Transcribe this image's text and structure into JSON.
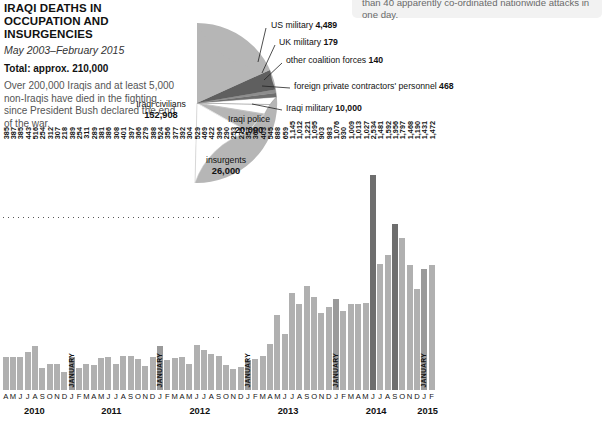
{
  "header": {
    "title": "IRAQI DEATHS IN OCCUPATION AND INSURGENCIES",
    "subtitle": "May 2003–February 2015",
    "total": "Total: approx. 210,000",
    "blurb": "Over 200,000 Iraqis and at least 5,000 non-Iraqis have died in the fighting since President Bush declared the end of the war."
  },
  "notebox": {
    "text": "than 40 apparently co-ordinated nationwide attacks in one day."
  },
  "pie_labels": {
    "civilians_name": "Iraqi civilians",
    "civilians_value": "152,908",
    "police_name": "Iraqi police",
    "police_value": "20,000",
    "insurgents_name": "insurgents",
    "insurgents_value": "26,000",
    "us_military": "US military",
    "us_military_value": "4,489",
    "uk_military": "UK military",
    "uk_military_value": "179",
    "other_coalition": "other coalition forces",
    "other_coalition_value": "140",
    "contractors": "foreign private contractors' personnel",
    "contractors_value": "468",
    "iraqi_military": "Iraqi military",
    "iraqi_military_value": "10,000"
  },
  "colors": {
    "pie_main": "#b6b6b6",
    "pie_dark": "#6e6e6e",
    "pie_mid": "#9a9a9a",
    "pie_light": "#ffffff",
    "bar_light": "#b0b0b0",
    "bar_dark": "#6e6e6e",
    "note_bg": "#f2f2f2"
  },
  "chart_data": {
    "type": "pie",
    "title": "IRAQI DEATHS IN OCCUPATION AND INSURGENCIES",
    "subtitle": "May 2003–February 2015",
    "total": 210000,
    "labels": [
      "Iraqi civilians",
      "Iraqi police",
      "insurgents",
      "Iraqi military",
      "foreign private contractors' personnel",
      "US military",
      "UK military",
      "other coalition forces"
    ],
    "values": [
      152908,
      20000,
      26000,
      10000,
      468,
      4489,
      179,
      140
    ],
    "legend": "labels placed around pie"
  },
  "chart_data_bars": {
    "type": "bar",
    "title": "Monthly Iraqi deaths",
    "xlabel": "",
    "ylabel": "",
    "ylim": [
      0,
      2534
    ],
    "grid": false,
    "categories": [
      "2010-A",
      "2010-M",
      "2010-J",
      "2010-J",
      "2010-A",
      "2010-S",
      "2010-O",
      "2010-N",
      "2010-D",
      "2011-JANUARY",
      "2011-F",
      "2011-M",
      "2011-A",
      "2011-M",
      "2011-J",
      "2011-J",
      "2011-A",
      "2011-S",
      "2011-O",
      "2011-N",
      "2011-D",
      "2012-JANUARY",
      "2012-F",
      "2012-M",
      "2012-A",
      "2012-M",
      "2012-J",
      "2012-J",
      "2012-A",
      "2012-S",
      "2012-O",
      "2012-N",
      "2012-D",
      "2013-JANUARY",
      "2013-F",
      "2013-M",
      "2013-A",
      "2013-M",
      "2013-J",
      "2013-J",
      "2013-A",
      "2013-S",
      "2013-O",
      "2013-N",
      "2013-D",
      "2014-JANUARY",
      "2014-F",
      "2014-M",
      "2014-A",
      "2014-M",
      "2014-J",
      "2014-J",
      "2014-A",
      "2014-S",
      "2014-O",
      "2014-N",
      "2014-D",
      "2015-JANUARY",
      "2015-F"
    ],
    "values": [
      385,
      387,
      385,
      443,
      516,
      254,
      312,
      307,
      218,
      389,
      254,
      311,
      289,
      381,
      386,
      308,
      401,
      397,
      366,
      279,
      388,
      524,
      356,
      377,
      392,
      304,
      529,
      469,
      422,
      396,
      290,
      253,
      275,
      357,
      360,
      403,
      545,
      888,
      659,
      1145,
      1012,
      1221,
      1095,
      903,
      983,
      1076,
      930,
      1009,
      1013,
      1027,
      2534,
      1481,
      1592,
      1956,
      1797,
      1468,
      1190,
      1431,
      1472
    ],
    "value_labels": [
      "385",
      "387",
      "385",
      "443",
      "516",
      "254",
      "312",
      "307",
      "218",
      "389",
      "254",
      "311",
      "289",
      "381",
      "386",
      "308",
      "401",
      "397",
      "366",
      "279",
      "388",
      "524",
      "356",
      "377",
      "392",
      "304",
      "529",
      "469",
      "422",
      "396",
      "290",
      "253",
      "275",
      "357",
      "360",
      "403",
      "545",
      "888",
      "659",
      "1,145",
      "1,012",
      "1,221",
      "1,095",
      "903",
      "983",
      "1,076",
      "930",
      "1,009",
      "1,013",
      "1,027",
      "2,534",
      "1,481",
      "1,592",
      "1,956",
      "1,797",
      "1,468",
      "1,190",
      "1,431",
      "1,472"
    ],
    "tick_labels": [
      "A",
      "M",
      "J",
      "J",
      "A",
      "S",
      "O",
      "N",
      "D",
      "J",
      "F",
      "M",
      "A",
      "M",
      "J",
      "J",
      "A",
      "S",
      "O",
      "N",
      "D",
      "J",
      "F",
      "M",
      "A",
      "M",
      "J",
      "J",
      "A",
      "S",
      "O",
      "N",
      "D",
      "J",
      "F",
      "M",
      "A",
      "M",
      "J",
      "J",
      "A",
      "S",
      "O",
      "N",
      "D",
      "J",
      "F",
      "M",
      "A",
      "M",
      "J",
      "J",
      "A",
      "S",
      "O",
      "N",
      "D",
      "J",
      "F"
    ],
    "january_markers": [
      9,
      21,
      33,
      45,
      57
    ],
    "january_text": "JANUARY",
    "dark_indices": [
      50,
      53
    ],
    "year_labels": [
      "2010",
      "2011",
      "2012",
      "2013",
      "2014",
      "2015"
    ]
  }
}
